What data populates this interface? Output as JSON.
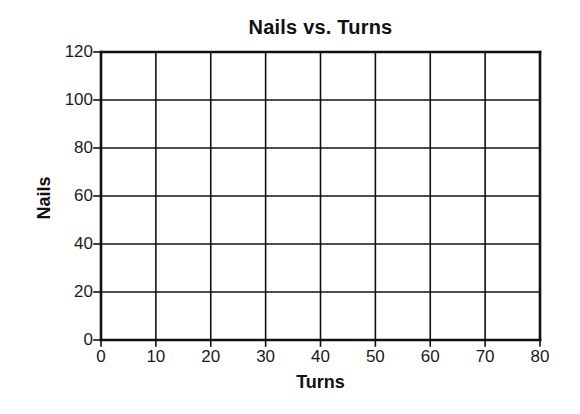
{
  "chart_data": {
    "type": "line",
    "title": "Nails vs. Turns",
    "xlabel": "Turns",
    "ylabel": "Nails",
    "xlim": [
      0,
      80
    ],
    "ylim": [
      0,
      120
    ],
    "x_ticks": [
      0,
      10,
      20,
      30,
      40,
      50,
      60,
      70,
      80
    ],
    "y_ticks": [
      0,
      20,
      40,
      60,
      80,
      100,
      120
    ],
    "grid": true,
    "legend": null,
    "series": []
  },
  "colors": {
    "grid": "#111111",
    "text": "#111111",
    "background": "#ffffff"
  }
}
